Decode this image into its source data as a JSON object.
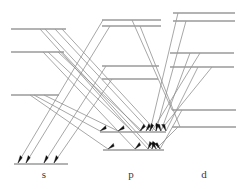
{
  "figure": {
    "type": "energy-level-diagram",
    "title": "",
    "colors": {
      "level_line": "#9a9a9a",
      "transition_line": "#8a8a8a",
      "arrow_head": "#101010",
      "label_text": "#3a3a3a",
      "background": "#ffffff"
    },
    "canvas": {
      "width": 246,
      "height": 189
    }
  },
  "columns": [
    {
      "id": "s",
      "label": "s",
      "label_x": 44,
      "label_y": 176
    },
    {
      "id": "p",
      "label": "p",
      "label_x": 131,
      "label_y": 176
    },
    {
      "id": "d",
      "label": "d",
      "label_x": 204,
      "label_y": 176
    }
  ],
  "levels": [
    {
      "column": "s",
      "index": 0,
      "x1": 11,
      "x2": 66,
      "y": 29
    },
    {
      "column": "s",
      "index": 1,
      "x1": 11,
      "x2": 64,
      "y": 52
    },
    {
      "column": "s",
      "index": 2,
      "x1": 11,
      "x2": 59,
      "y": 95
    },
    {
      "column": "s",
      "index": 3,
      "x1": 14,
      "x2": 68,
      "y": 164
    },
    {
      "column": "p",
      "index": 0,
      "x1": 102,
      "x2": 161,
      "y": 20
    },
    {
      "column": "p",
      "index": 1,
      "x1": 102,
      "x2": 161,
      "y": 26
    },
    {
      "column": "p",
      "index": 2,
      "x1": 102,
      "x2": 159,
      "y": 66
    },
    {
      "column": "p",
      "index": 3,
      "x1": 102,
      "x2": 158,
      "y": 79
    },
    {
      "column": "p",
      "index": 4,
      "x1": 100,
      "x2": 166,
      "y": 132
    },
    {
      "column": "p",
      "index": 5,
      "x1": 103,
      "x2": 164,
      "y": 150
    },
    {
      "column": "d",
      "index": 0,
      "x1": 173,
      "x2": 235,
      "y": 13
    },
    {
      "column": "d",
      "index": 1,
      "x1": 173,
      "x2": 235,
      "y": 21
    },
    {
      "column": "d",
      "index": 2,
      "x1": 170,
      "x2": 234,
      "y": 53
    },
    {
      "column": "d",
      "index": 3,
      "x1": 170,
      "x2": 234,
      "y": 67
    },
    {
      "column": "d",
      "index": 4,
      "x1": 172,
      "x2": 236,
      "y": 110
    },
    {
      "column": "d",
      "index": 5,
      "x1": 172,
      "x2": 236,
      "y": 127
    }
  ],
  "transitions": [
    {
      "from": "p0",
      "to": "s3",
      "x1": 103,
      "y1": 20,
      "x2": 18,
      "y2": 163
    },
    {
      "from": "p1",
      "to": "s3",
      "x1": 110,
      "y1": 26,
      "x2": 26,
      "y2": 163
    },
    {
      "from": "p2",
      "to": "s3",
      "x1": 106,
      "y1": 66,
      "x2": 44,
      "y2": 163
    },
    {
      "from": "p3",
      "to": "s3",
      "x1": 112,
      "y1": 79,
      "x2": 54,
      "y2": 163
    },
    {
      "from": "s0",
      "to": "p4",
      "x1": 45,
      "y1": 29,
      "x2": 140,
      "y2": 131
    },
    {
      "from": "s0b",
      "to": "p4",
      "x1": 55,
      "y1": 29,
      "x2": 150,
      "y2": 131
    },
    {
      "from": "s1",
      "to": "p4",
      "x1": 48,
      "y1": 52,
      "x2": 132,
      "y2": 131
    },
    {
      "from": "s1b",
      "to": "p4",
      "x1": 58,
      "y1": 52,
      "x2": 142,
      "y2": 131
    },
    {
      "from": "s2",
      "to": "p4",
      "x1": 34,
      "y1": 95,
      "x2": 100,
      "y2": 131
    },
    {
      "from": "s2b",
      "to": "p4",
      "x1": 44,
      "y1": 95,
      "x2": 118,
      "y2": 131
    },
    {
      "from": "s0c",
      "to": "p5",
      "x1": 40,
      "y1": 29,
      "x2": 148,
      "y2": 149
    },
    {
      "from": "s1c",
      "to": "p5",
      "x1": 43,
      "y1": 52,
      "x2": 135,
      "y2": 149
    },
    {
      "from": "s2c",
      "to": "p5",
      "x1": 30,
      "y1": 95,
      "x2": 108,
      "y2": 149
    },
    {
      "from": "d0",
      "to": "p4",
      "x1": 178,
      "y1": 13,
      "x2": 150,
      "y2": 131
    },
    {
      "from": "d1",
      "to": "p4",
      "x1": 186,
      "y1": 21,
      "x2": 156,
      "y2": 131
    },
    {
      "from": "d2",
      "to": "p4",
      "x1": 190,
      "y1": 53,
      "x2": 161,
      "y2": 131
    },
    {
      "from": "d3",
      "to": "p4",
      "x1": 198,
      "y1": 67,
      "x2": 166,
      "y2": 131
    },
    {
      "from": "d4",
      "to": "p5",
      "x1": 182,
      "y1": 110,
      "x2": 160,
      "y2": 149
    },
    {
      "from": "d5",
      "to": "p5",
      "x1": 178,
      "y1": 127,
      "x2": 156,
      "y2": 149
    },
    {
      "from": "p0b",
      "to": "d-down",
      "x1": 132,
      "y1": 20,
      "x2": 172,
      "y2": 110
    },
    {
      "from": "p1b",
      "to": "d-down",
      "x1": 140,
      "y1": 26,
      "x2": 180,
      "y2": 127
    },
    {
      "from": "d2b",
      "to": "p4b",
      "x1": 200,
      "y1": 53,
      "x2": 152,
      "y2": 131
    },
    {
      "from": "d3b",
      "to": "p4b",
      "x1": 212,
      "y1": 67,
      "x2": 160,
      "y2": 131
    },
    {
      "from": "s0d",
      "to": "p4c",
      "x1": 62,
      "y1": 29,
      "x2": 156,
      "y2": 131
    },
    {
      "from": "s1d",
      "to": "p5b",
      "x1": 62,
      "y1": 52,
      "x2": 152,
      "y2": 149
    }
  ],
  "arrowheads": [
    {
      "on": "s3",
      "x": 18,
      "y": 163,
      "angle": -59
    },
    {
      "on": "s3",
      "x": 26,
      "y": 163,
      "angle": -59
    },
    {
      "on": "s3",
      "x": 44,
      "y": 163,
      "angle": -59
    },
    {
      "on": "s3",
      "x": 54,
      "y": 163,
      "angle": -59
    },
    {
      "on": "p4",
      "x": 100,
      "y": 131,
      "angle": -29
    },
    {
      "on": "p4",
      "x": 118,
      "y": 131,
      "angle": -29
    },
    {
      "on": "p4",
      "x": 140,
      "y": 131,
      "angle": -47
    },
    {
      "on": "p4",
      "x": 146,
      "y": 131,
      "angle": -55
    },
    {
      "on": "p4",
      "x": 150,
      "y": 131,
      "angle": -66
    },
    {
      "on": "p4",
      "x": 156,
      "y": 131,
      "angle": -76
    },
    {
      "on": "p4",
      "x": 161,
      "y": 131,
      "angle": 250
    },
    {
      "on": "p4",
      "x": 166,
      "y": 131,
      "angle": 250
    },
    {
      "on": "p5",
      "x": 108,
      "y": 149,
      "angle": -32
    },
    {
      "on": "p5",
      "x": 135,
      "y": 149,
      "angle": -42
    },
    {
      "on": "p5",
      "x": 148,
      "y": 149,
      "angle": -62
    },
    {
      "on": "p5",
      "x": 152,
      "y": 149,
      "angle": -70
    },
    {
      "on": "p5",
      "x": 156,
      "y": 149,
      "angle": 245
    },
    {
      "on": "p5",
      "x": 160,
      "y": 149,
      "angle": 238
    }
  ]
}
